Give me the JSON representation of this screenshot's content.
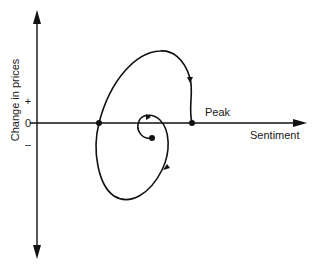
{
  "diagram": {
    "y_axis_label": "Change in prices",
    "x_axis_label": "Sentiment",
    "y_ticks": {
      "plus": "+",
      "zero": "0",
      "minus": "–"
    },
    "annotations": {
      "peak": "Peak"
    },
    "colors": {
      "line": "#111111",
      "background": "#ffffff"
    }
  }
}
